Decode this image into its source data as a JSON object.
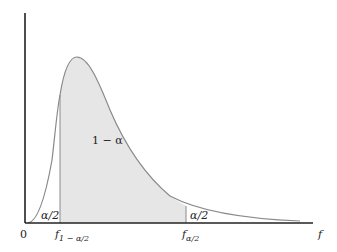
{
  "diagram": {
    "type": "F-distribution probability density with two-tailed critical regions",
    "center_region_label": "1 − α",
    "left_tail_label": "α/2",
    "right_tail_label": "α/2",
    "origin_label": "0",
    "x_axis_label": "f",
    "left_critical_label_main": "f",
    "left_critical_label_sub": "1 − α/2",
    "right_critical_label_main": "f",
    "right_critical_label_sub": "α/2",
    "colors": {
      "shaded_region": "#e6e6e6",
      "curve": "#8a8a8a",
      "axis": "#222222"
    }
  }
}
